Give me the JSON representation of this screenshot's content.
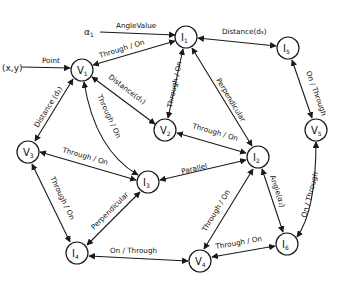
{
  "nodes": [
    {
      "id": "V1",
      "label": "V",
      "sub": "1",
      "x": 82,
      "y": 70
    },
    {
      "id": "I1",
      "label": "I",
      "sub": "1",
      "x": 186,
      "y": 37
    },
    {
      "id": "I5",
      "label": "I",
      "sub": "5",
      "x": 288,
      "y": 48
    },
    {
      "id": "V2",
      "label": "V",
      "sub": "2",
      "x": 165,
      "y": 130
    },
    {
      "id": "V5",
      "label": "V",
      "sub": "5",
      "x": 316,
      "y": 130
    },
    {
      "id": "V3",
      "label": "V",
      "sub": "3",
      "x": 28,
      "y": 152
    },
    {
      "id": "I2",
      "label": "I",
      "sub": "2",
      "x": 258,
      "y": 157
    },
    {
      "id": "I3",
      "label": "I",
      "sub": "3",
      "x": 148,
      "y": 182
    },
    {
      "id": "I4",
      "label": "I",
      "sub": "4",
      "x": 77,
      "y": 253
    },
    {
      "id": "V4",
      "label": "V",
      "sub": "4",
      "x": 200,
      "y": 261
    },
    {
      "id": "I6",
      "label": "I",
      "sub": "6",
      "x": 287,
      "y": 244
    }
  ],
  "free_labels": {
    "alpha": "α",
    "alpha_sub": "1",
    "xy": "(x,y)"
  },
  "edges": [
    {
      "from": "alpha1",
      "to": "I1",
      "label": "AngleValue"
    },
    {
      "from": "xy",
      "to": "V1",
      "label": "Point"
    },
    {
      "from": "V1",
      "to": "I1",
      "label": "Through / On"
    },
    {
      "from": "I1",
      "to": "I5",
      "label": "Distance(d₃)"
    },
    {
      "from": "I1",
      "to": "V2",
      "label": "Through / On"
    },
    {
      "from": "V1",
      "to": "V2",
      "label": "Distance(d₁)"
    },
    {
      "from": "I1",
      "to": "I2",
      "label": "Perpendicular"
    },
    {
      "from": "I5",
      "to": "V5",
      "label": "On / Through"
    },
    {
      "from": "V1",
      "to": "V3",
      "label": "Distance (d₂)"
    },
    {
      "from": "V1",
      "to": "I3",
      "label": "Through / On"
    },
    {
      "from": "V2",
      "to": "I2",
      "label": "Through / On"
    },
    {
      "from": "V3",
      "to": "I3",
      "label": "Through / On"
    },
    {
      "from": "I3",
      "to": "I2",
      "label": "Parallel"
    },
    {
      "from": "V3",
      "to": "I4",
      "label": "Through / On"
    },
    {
      "from": "I3",
      "to": "I4",
      "label": "Perpendicular"
    },
    {
      "from": "V4",
      "to": "I2",
      "label": "Through / On"
    },
    {
      "from": "I2",
      "to": "I6",
      "label": "Angle(α₂)"
    },
    {
      "from": "V5",
      "to": "I6",
      "label": "On / Through"
    },
    {
      "from": "I4",
      "to": "V4",
      "label": "On / Through"
    },
    {
      "from": "V4",
      "to": "I6",
      "label": "Through / On"
    }
  ],
  "colors": {
    "stroke": "#1a1a1a",
    "background": "#ffffff"
  }
}
